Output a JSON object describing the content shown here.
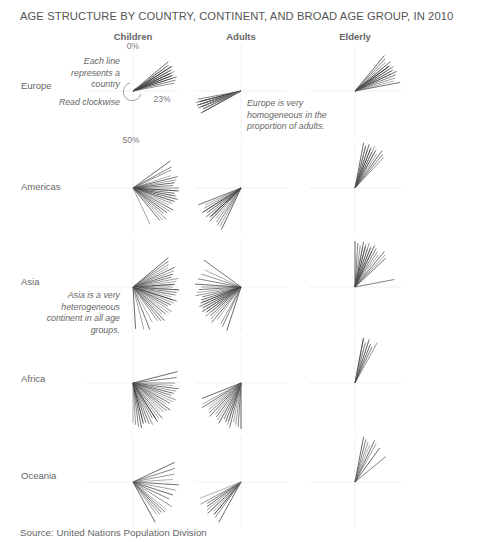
{
  "chart_data": {
    "type": "radial-line",
    "title": "AGE STRUCTURE BY COUNTRY, CONTINENT, AND BROAD AGE GROUP, IN 2010",
    "encoding": "Each line is a country; angle = share of population (0% at top, read clockwise, 50% at bottom)",
    "columns": [
      "Children",
      "Adults",
      "Elderly"
    ],
    "rows": [
      "Europe",
      "Americas",
      "Asia",
      "Africa",
      "Oceania"
    ],
    "tick_labels": {
      "top": "0%",
      "right": "23%",
      "bottom": "50%"
    },
    "series": [
      {
        "name": "Europe",
        "Children": [
          14,
          15,
          15,
          16,
          16,
          17,
          17,
          18,
          18,
          19,
          19,
          20,
          20,
          21,
          22,
          15,
          16,
          17,
          18,
          19
        ],
        "Adults": [
          67,
          67,
          68,
          68,
          69,
          69,
          69,
          70,
          70,
          70,
          71,
          71,
          71,
          72,
          68,
          69,
          70,
          70
        ],
        "Elderly": [
          11,
          12,
          13,
          14,
          14,
          15,
          15,
          16,
          16,
          17,
          17,
          18,
          18,
          19,
          20,
          21,
          22,
          16,
          15
        ]
      },
      {
        "name": "Americas",
        "Children": [
          15,
          17,
          18,
          20,
          21,
          22,
          23,
          24,
          25,
          26,
          27,
          28,
          29,
          30,
          31,
          32,
          33,
          34,
          35,
          36,
          37,
          38,
          39,
          43,
          26,
          28,
          30
        ],
        "Adults": [
          57,
          59,
          60,
          61,
          62,
          62,
          63,
          63,
          64,
          64,
          65,
          65,
          66,
          66,
          67,
          68,
          69,
          58,
          63
        ],
        "Elderly": [
          3,
          4,
          4,
          5,
          5,
          6,
          6,
          7,
          7,
          8,
          8,
          9,
          10,
          11,
          12
        ]
      },
      {
        "name": "Asia",
        "Children": [
          14,
          15,
          16,
          17,
          18,
          19,
          20,
          21,
          22,
          23,
          24,
          25,
          26,
          27,
          28,
          29,
          30,
          31,
          32,
          33,
          34,
          35,
          36,
          37,
          38,
          39,
          40,
          42,
          44,
          46,
          49,
          24,
          26,
          28,
          30
        ],
        "Adults": [
          55,
          57,
          58,
          60,
          61,
          62,
          63,
          64,
          64,
          65,
          65,
          66,
          66,
          67,
          67,
          68,
          68,
          69,
          70,
          71,
          72,
          73,
          74,
          75,
          76,
          78,
          80,
          82,
          85,
          66,
          69
        ],
        "Elderly": [
          0,
          1,
          2,
          3,
          3,
          4,
          4,
          5,
          5,
          6,
          6,
          7,
          7,
          8,
          9,
          10,
          11,
          12,
          13,
          22
        ]
      },
      {
        "name": "Africa",
        "Children": [
          21,
          23,
          25,
          26,
          27,
          28,
          29,
          30,
          31,
          32,
          33,
          34,
          35,
          36,
          37,
          38,
          39,
          40,
          41,
          42,
          43,
          44,
          45,
          46,
          47,
          48,
          49,
          50,
          41,
          44,
          46
        ],
        "Adults": [
          50,
          51,
          52,
          53,
          54,
          55,
          56,
          57,
          58,
          59,
          60,
          61,
          62,
          63,
          64,
          65,
          66,
          67,
          69,
          55,
          58
        ],
        "Elderly": [
          3,
          3,
          4,
          4,
          5,
          5,
          6,
          7,
          8
        ]
      },
      {
        "name": "Oceania",
        "Children": [
          18,
          20,
          22,
          24,
          26,
          28,
          30,
          32,
          34,
          36,
          38,
          40,
          42,
          37,
          39
        ],
        "Adults": [
          58,
          60,
          61,
          62,
          63,
          64,
          65,
          66,
          67,
          69,
          61,
          63
        ],
        "Elderly": [
          3,
          4,
          5,
          6,
          7,
          8,
          10,
          14
        ]
      }
    ],
    "grid": true,
    "legend": "none"
  },
  "page": {
    "title": "AGE STRUCTURE BY COUNTRY, CONTINENT, AND BROAD AGE GROUP, IN 2010",
    "columns": [
      "Children",
      "Adults",
      "Elderly"
    ],
    "rows": [
      "Europe",
      "Americas",
      "Asia",
      "Africa",
      "Oceania"
    ],
    "ticks": {
      "zero": "0%",
      "quarter": "23%",
      "half": "50%"
    },
    "annotations": {
      "each_line": [
        "Each line",
        "represents a",
        "country"
      ],
      "read_clockwise": "Read clockwise",
      "europe_note": [
        "Europe is very",
        "homogeneous in the",
        "proportion of adults."
      ],
      "asia_note": [
        "Asia is a very",
        "heterogeneous",
        "continent in all age",
        "groups."
      ]
    },
    "source": "Source: United Nations Population Division"
  }
}
